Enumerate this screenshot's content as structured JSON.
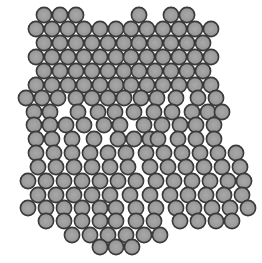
{
  "image": {
    "width": 262,
    "height": 263,
    "background": "#ffffff",
    "particle_fill": "#9c9c9c",
    "particle_stroke": "#3a3a3a",
    "radius": 7.6
  },
  "rows": [
    {
      "y": 15,
      "xs": [
        44,
        60,
        76,
        139,
        171,
        187
      ]
    },
    {
      "y": 29,
      "xs": [
        36,
        52,
        68,
        84,
        100,
        116,
        131,
        147,
        163,
        179,
        195,
        211
      ]
    },
    {
      "y": 43,
      "xs": [
        44,
        60,
        76,
        92,
        108,
        124,
        139,
        155,
        171,
        187,
        203
      ]
    },
    {
      "y": 57,
      "xs": [
        36,
        52,
        68,
        84,
        100,
        116,
        131,
        147,
        163,
        179,
        195,
        211
      ]
    },
    {
      "y": 71,
      "xs": [
        44,
        60,
        76,
        92,
        108,
        124,
        139,
        155,
        171,
        187,
        203
      ]
    },
    {
      "y": 85,
      "xs": [
        36,
        52,
        68,
        84,
        100,
        116,
        131,
        147,
        163,
        179,
        195,
        211
      ]
    },
    {
      "y": 98,
      "xs": [
        26,
        42,
        58,
        76,
        92,
        108,
        124,
        141,
        157,
        176,
        198,
        216
      ]
    },
    {
      "y": 112,
      "xs": [
        34,
        50,
        78,
        98,
        115,
        134,
        154,
        172,
        192,
        208,
        222
      ]
    },
    {
      "y": 125,
      "xs": [
        34,
        50,
        66,
        84,
        104,
        120,
        144,
        162,
        180,
        196,
        214
      ]
    },
    {
      "y": 139,
      "xs": [
        36,
        52,
        72,
        94,
        118,
        134,
        150,
        158,
        178,
        196,
        214
      ]
    },
    {
      "y": 153,
      "xs": [
        36,
        54,
        72,
        90,
        108,
        126,
        146,
        164,
        182,
        200,
        218,
        236
      ]
    },
    {
      "y": 167,
      "xs": [
        38,
        56,
        74,
        92,
        110,
        128,
        150,
        168,
        186,
        204,
        222,
        240
      ]
    },
    {
      "y": 181,
      "xs": [
        28,
        46,
        64,
        82,
        100,
        118,
        136,
        156,
        174,
        192,
        210,
        228,
        244
      ]
    },
    {
      "y": 195,
      "xs": [
        38,
        56,
        74,
        92,
        110,
        130,
        150,
        170,
        188,
        206,
        224,
        242
      ]
    },
    {
      "y": 208,
      "xs": [
        28,
        46,
        64,
        82,
        100,
        116,
        136,
        156,
        176,
        194,
        212,
        230,
        248
      ]
    },
    {
      "y": 221,
      "xs": [
        46,
        64,
        82,
        100,
        116,
        136,
        154,
        180,
        198,
        216,
        232
      ]
    },
    {
      "y": 235,
      "xs": [
        72,
        90,
        108,
        126,
        144,
        160
      ]
    },
    {
      "y": 247,
      "xs": [
        100,
        116,
        132
      ]
    }
  ]
}
